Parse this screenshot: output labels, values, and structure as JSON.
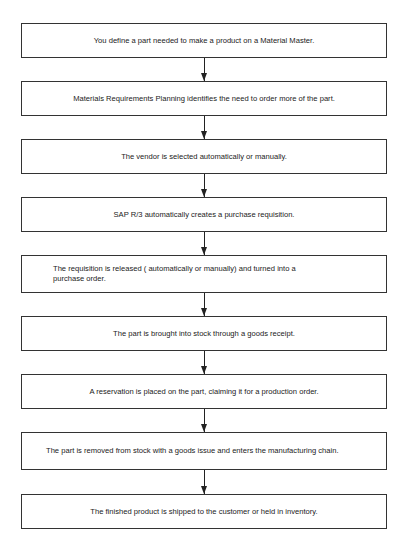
{
  "flowchart": {
    "steps": [
      {
        "text": "You define a part needed to make a product on a Material Master."
      },
      {
        "text": "Materials Requirements Planning identifies the need to order more of the part."
      },
      {
        "text": "The vendor is selected automatically or manually."
      },
      {
        "text": "SAP R/3 automatically creates a purchase requisition."
      },
      {
        "text": "The requisition is released ( automatically or manually) and turned into a purchase order."
      },
      {
        "text": "The part is brought into stock through a goods receipt."
      },
      {
        "text": "A reservation is placed on the part, claiming it for a production order."
      },
      {
        "text": "The part is removed from stock with a goods issue and enters the manufacturing chain."
      },
      {
        "text": "The finished product is shipped to the customer or held in inventory."
      }
    ],
    "colors": {
      "border": "#333333",
      "arrow": "#222222",
      "text": "#222222",
      "background": "#ffffff"
    }
  }
}
